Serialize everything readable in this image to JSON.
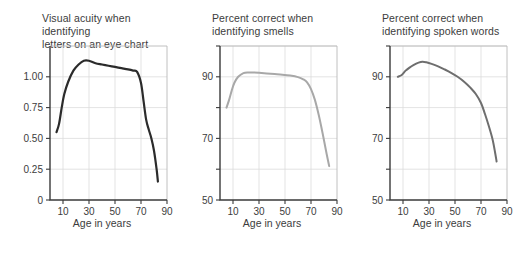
{
  "figure": {
    "background": "#ffffff",
    "panel_count": 3
  },
  "chart_data": [
    {
      "type": "line",
      "title": "Visual acuity when identifying\nletters on an eye chart",
      "xlabel": "Age in years",
      "ylabel": "",
      "xlim": [
        0,
        90
      ],
      "ylim": [
        0,
        1.25
      ],
      "xticks": [
        10,
        30,
        50,
        70,
        90
      ],
      "xtick_labels": [
        "10",
        "30",
        "50",
        "70",
        "90"
      ],
      "yticks": [
        0,
        0.25,
        0.5,
        0.75,
        1.0
      ],
      "ytick_labels": [
        "0",
        "0.25",
        "0.50",
        "0.75",
        "1.00"
      ],
      "grid": true,
      "legend": "none",
      "color": "#2b2b2b",
      "line_width": 2.2,
      "x": [
        5,
        7,
        9,
        11,
        14,
        18,
        22,
        26,
        30,
        35,
        40,
        45,
        50,
        55,
        60,
        64,
        67,
        70,
        72,
        74,
        76,
        78,
        80,
        82,
        83
      ],
      "values": [
        0.55,
        0.62,
        0.75,
        0.86,
        0.96,
        1.05,
        1.1,
        1.13,
        1.13,
        1.11,
        1.1,
        1.09,
        1.08,
        1.07,
        1.06,
        1.05,
        1.04,
        0.95,
        0.8,
        0.65,
        0.57,
        0.5,
        0.4,
        0.25,
        0.15
      ]
    },
    {
      "type": "line",
      "title": "Percent correct when\nidentifying smells",
      "xlabel": "Age in years",
      "ylabel": "",
      "xlim": [
        0,
        90
      ],
      "ylim": [
        50,
        100
      ],
      "xticks": [
        10,
        30,
        50,
        70,
        90
      ],
      "xtick_labels": [
        "10",
        "30",
        "50",
        "70",
        "90"
      ],
      "yticks": [
        50,
        60,
        70,
        80,
        90,
        100
      ],
      "ytick_labels": [
        "50",
        "",
        "70",
        "",
        "90",
        ""
      ],
      "grid": true,
      "legend": "none",
      "color": "#a8a8a8",
      "line_width": 2.0,
      "x": [
        5,
        7,
        9,
        11,
        14,
        18,
        22,
        26,
        30,
        36,
        42,
        48,
        54,
        60,
        64,
        67,
        70,
        73,
        76,
        79,
        82,
        84
      ],
      "values": [
        80.0,
        82.5,
        85.5,
        88.0,
        90.0,
        91.2,
        91.4,
        91.4,
        91.3,
        91.1,
        90.9,
        90.7,
        90.4,
        89.9,
        89.2,
        88.2,
        86.0,
        82.5,
        77.5,
        71.5,
        65.0,
        61.0
      ]
    },
    {
      "type": "line",
      "title": "Percent correct when\nidentifying spoken words",
      "xlabel": "Age in years",
      "ylabel": "",
      "xlim": [
        0,
        90
      ],
      "ylim": [
        50,
        100
      ],
      "xticks": [
        10,
        30,
        50,
        70,
        90
      ],
      "xtick_labels": [
        "10",
        "30",
        "50",
        "70",
        "90"
      ],
      "yticks": [
        50,
        60,
        70,
        80,
        90,
        100
      ],
      "ytick_labels": [
        "50",
        "",
        "70",
        "",
        "90",
        ""
      ],
      "grid": true,
      "legend": "none",
      "color": "#6e6e6e",
      "line_width": 2.0,
      "x": [
        6,
        9,
        12,
        15,
        18,
        22,
        25,
        28,
        32,
        37,
        42,
        47,
        52,
        57,
        62,
        66,
        70,
        73,
        76,
        79,
        81,
        82
      ],
      "values": [
        90.0,
        90.6,
        92.0,
        93.0,
        93.8,
        94.6,
        94.9,
        94.7,
        94.2,
        93.4,
        92.4,
        91.3,
        90.0,
        88.4,
        86.4,
        84.4,
        81.5,
        78.0,
        74.0,
        69.5,
        65.0,
        62.5
      ]
    }
  ]
}
